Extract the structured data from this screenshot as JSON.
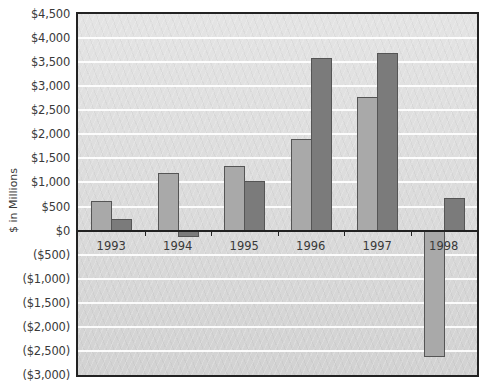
{
  "chart_data": {
    "type": "bar",
    "title": "",
    "xlabel": "",
    "ylabel": "$ in Millions",
    "ylim": [
      -3000,
      4500
    ],
    "ytick_step": 500,
    "yticks": [
      "$4,500",
      "$4,000",
      "$3,500",
      "$3,000",
      "$2,500",
      "$2,000",
      "$1,500",
      "$1,000",
      "$500",
      "$0",
      "($500)",
      "($1,000)",
      "($1,500)",
      "($2,000)",
      "($2,500)",
      "($3,000)"
    ],
    "grid": true,
    "legend": null,
    "categories": [
      "1993",
      "1994",
      "1995",
      "1996",
      "1997",
      "1998"
    ],
    "series": [
      {
        "name": "Series 1",
        "color": "#a9a9a9",
        "values": [
          620,
          1190,
          1350,
          1910,
          2770,
          -2620
        ]
      },
      {
        "name": "Series 2",
        "color": "#7b7b7b",
        "values": [
          250,
          -130,
          1040,
          3580,
          3700,
          670
        ]
      }
    ]
  },
  "colors": {
    "plot_background": "#dcdcdc",
    "gridline": "#ffffff",
    "axis": "#222222",
    "text": "#3a3a3a"
  }
}
